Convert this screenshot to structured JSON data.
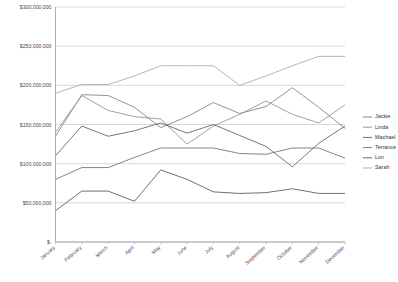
{
  "chart_data": {
    "type": "line",
    "title": "",
    "xlabel": "",
    "ylabel": "",
    "ylim": [
      0,
      300000000
    ],
    "ytick_values": [
      0,
      50000000,
      100000000,
      150000000,
      200000000,
      250000000,
      300000000
    ],
    "ytick_labels": [
      "$-",
      "$50,000,000",
      "$100,000,000",
      "$150,000,000",
      "$200,000,000",
      "$250,000,000",
      "$300,000,000"
    ],
    "categories": [
      "January",
      "February",
      "March",
      "April",
      "May",
      "June",
      "July",
      "August",
      "September",
      "October",
      "November",
      "December"
    ],
    "grid": "horizontal",
    "legend_position": "right",
    "series": [
      {
        "name": "Jackie",
        "color": "#808080",
        "values": [
          135000000,
          188000000,
          187000000,
          172000000,
          146000000,
          160000000,
          178000000,
          164000000,
          173000000,
          197000000,
          172000000,
          145000000
        ]
      },
      {
        "name": "Linda",
        "color": "#8f8f8f",
        "values": [
          140000000,
          187000000,
          168000000,
          160000000,
          157000000,
          125000000,
          148000000,
          163000000,
          180000000,
          163000000,
          152000000,
          175000000
        ]
      },
      {
        "name": "Machael",
        "color": "#606060",
        "values": [
          110000000,
          148000000,
          135000000,
          142000000,
          152000000,
          139000000,
          150000000,
          136000000,
          122000000,
          96000000,
          126000000,
          148000000
        ]
      },
      {
        "name": "Terrance",
        "color": "#707070",
        "values": [
          80000000,
          95000000,
          95000000,
          108000000,
          120000000,
          120000000,
          120000000,
          113000000,
          112000000,
          120000000,
          120000000,
          107000000
        ]
      },
      {
        "name": "Lon",
        "color": "#555555",
        "values": [
          40000000,
          65000000,
          65000000,
          52000000,
          92000000,
          80000000,
          64000000,
          62000000,
          63000000,
          68000000,
          62000000,
          62000000
        ]
      },
      {
        "name": "Sarah",
        "color": "#a8a8a8",
        "values": [
          190000000,
          201000000,
          201000000,
          212000000,
          225000000,
          225000000,
          225000000,
          200000000,
          212000000,
          225000000,
          237000000,
          237000000
        ]
      }
    ]
  },
  "legend": {
    "items": [
      {
        "label": "Jackie"
      },
      {
        "label": "Linda"
      },
      {
        "label": "Machael"
      },
      {
        "label": "Terrance"
      },
      {
        "label": "Lon"
      },
      {
        "label": "Sarah"
      }
    ]
  }
}
